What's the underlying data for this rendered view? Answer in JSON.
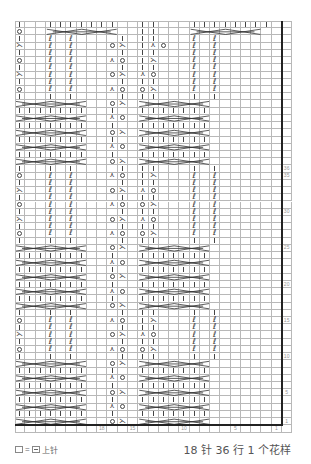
{
  "chart_data": {
    "type": "table",
    "grid": {
      "stitch_columns": 26,
      "rows": 56,
      "cell_w": 10.27,
      "cell_h": 7.22
    },
    "repeat": {
      "stitches": 18,
      "rows": 36
    },
    "column_labels": [
      {
        "col": 18,
        "label": "18"
      },
      {
        "col": 15,
        "label": "15"
      },
      {
        "col": 10,
        "label": "10"
      },
      {
        "col": 5,
        "label": "5"
      },
      {
        "col": 1,
        "label": "1"
      }
    ],
    "row_labels": [
      {
        "row": 36,
        "label": "36"
      },
      {
        "row": 35,
        "label": "35"
      },
      {
        "row": 30,
        "label": "30"
      },
      {
        "row": 25,
        "label": "25"
      },
      {
        "row": 20,
        "label": "20"
      },
      {
        "row": 15,
        "label": "15"
      },
      {
        "row": 10,
        "label": "10"
      },
      {
        "row": 5,
        "label": "5"
      },
      {
        "row": 1,
        "label": "1"
      }
    ],
    "symbols": {
      "|": "knit",
      "O": "yarn-over",
      "<": "left-decrease",
      ">": "right-decrease",
      "Q": "twisted-knit",
      ".": "purl (blank)",
      "X": "cable-cross-row"
    },
    "rows_top_to_bottom": [
      "|..|||||||..||...||||||||..",
      "O..XXXXXXX..||...XXXXXXX...",
      "|..Q.Q....|.||...Q.Q.......",
      "<..Q.Q...O<.|>O..Q.Q.......",
      "|..Q.Q....|.||...Q.Q.......",
      "O..Q.Q...>O.|<...Q.Q.......",
      "|..Q.Q....|.||...Q.Q.......",
      "<..Q.Q...O<.>O...Q.Q.......",
      "|..Q.Q....|.||...Q.Q.......",
      "O..Q.Q...>O.O<...Q.Q.......",
      "|..|.|....|.||...|.|.......",
      "XXXXXXX..O<.XXXXXXX........",
      "|||||||..|..|||||||........",
      "XXXXXXX..>O.XXXXXXX........",
      "|||||||..|..|||||||........",
      "XXXXXXX..O<.XXXXXXX........",
      "|||||||..|..|||||||........",
      "XXXXXXX..>O.XXXXXXX........",
      "|||||||..|..|||||||........",
      "XXXXXXX..O<.XXXXXXX........",
      "|..|.|....|.||...|.|.......",
      "O..Q.Q...>O.|<...Q.Q.......",
      "|..Q.Q....|.||...Q.Q.......",
      "<..Q.Q...O<.>O...Q.Q.......",
      "|..Q.Q....|.||...Q.Q.......",
      "O..Q.Q...>O.O<...Q.Q.......",
      "|..Q.Q....|.||...Q.Q.......",
      "<..Q.Q...O<.>O...Q.Q.......",
      "|..Q.Q....|.||...Q.Q.......",
      "O..Q.Q...>O.O<...Q.Q.......",
      "|..|.|....|.||...|.|.......",
      "XXXXXXX..O<.XXXXXXX........",
      "|||||||..|..|||||||........",
      "XXXXXXX..>O.XXXXXXX........",
      "|||||||..|..|||||||........",
      "XXXXXXX..O<.XXXXXXX........",
      "|||||||..|..|||||||........",
      "XXXXXXX..>O.XXXXXXX........",
      "|||||||..|..|||||||........",
      "XXXXXXX..O<.XXXXXXX........",
      "|..|.|....|.||...|.|.......",
      "O..Q.Q...>O.|<...Q.Q.......",
      "|..Q.Q....|.||...Q.Q.......",
      "<..Q.Q...O<.>O...Q.Q.......",
      "|..Q.Q....|.||...Q.Q.......",
      "O..Q.Q...>O.O<...Q.Q.......",
      "|..|.|....|.||...|.|.......",
      "XXXXXXX..O<.XXXXXXX........",
      "|||||||..|..|||||||........",
      "XXXXXXX..>O.XXXXXXX........",
      "|||||||..|..|||||||........",
      "XXXXXXX..O<.XXXXXXX........",
      "|||||||..|..|||||||........",
      "XXXXXXX..>O.XXXXXXX........",
      "|||||||..|..|||||||........",
      "XXXXXXX..O<.XXXXXXX........"
    ]
  },
  "legend": {
    "equals": "=",
    "label": "上针"
  },
  "footer": {
    "summary": "18 针 36 行 1 个花样"
  }
}
